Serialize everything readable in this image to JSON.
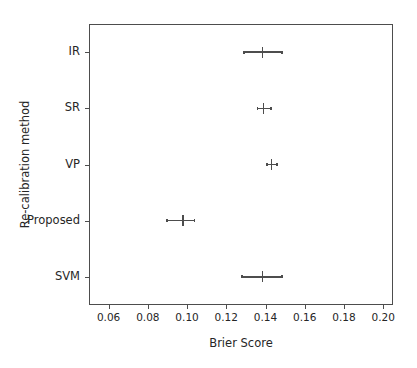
{
  "chart_data": {
    "type": "scatter",
    "title": "",
    "xlabel": "Brier Score",
    "ylabel": "Re-calibration method",
    "xlim": [
      0.05,
      0.205
    ],
    "grid": false,
    "legend": null,
    "orientation": "horizontal",
    "categories": [
      "SVM",
      "Proposed",
      "VP",
      "SR",
      "IR"
    ],
    "values": [
      0.1385,
      0.098,
      0.143,
      0.139,
      0.1385
    ],
    "errors_low": [
      0.1277,
      0.0895,
      0.1405,
      0.1355,
      0.1287
    ],
    "errors_high": [
      0.148,
      0.1035,
      0.1455,
      0.1425,
      0.148
    ],
    "xticks": [
      0.06,
      0.08,
      0.1,
      0.12,
      0.14,
      0.16,
      0.18,
      0.2
    ],
    "xtick_labels": [
      "0.06",
      "0.08",
      "0.10",
      "0.12",
      "0.14",
      "0.16",
      "0.18",
      "0.20"
    ],
    "yticks": [
      "SVM",
      "Proposed",
      "VP",
      "SR",
      "IR"
    ],
    "marker_color": "#4d4d4d",
    "axis_color": "#4d4d4d",
    "text_color": "#262626",
    "background": "#ffffff",
    "points": [
      {
        "label": "SVM",
        "value": 0.1385,
        "low": 0.1277,
        "high": 0.148
      },
      {
        "label": "Proposed",
        "value": 0.098,
        "low": 0.0895,
        "high": 0.1035
      },
      {
        "label": "VP",
        "value": 0.143,
        "low": 0.1405,
        "high": 0.1455
      },
      {
        "label": "SR",
        "value": 0.139,
        "low": 0.1355,
        "high": 0.1425
      },
      {
        "label": "IR",
        "value": 0.1385,
        "low": 0.1287,
        "high": 0.148
      }
    ]
  }
}
